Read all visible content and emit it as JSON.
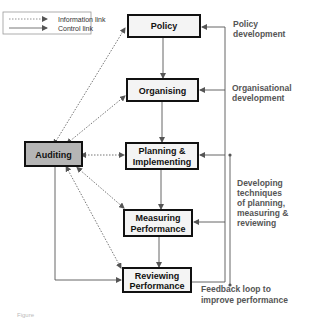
{
  "legend": {
    "information_link": "Information link",
    "control_link": "Control link"
  },
  "boxes": {
    "policy": "Policy",
    "organising": "Organising",
    "planning": [
      "Planning &",
      "Implementing"
    ],
    "measuring": [
      "Measuring",
      "Performance"
    ],
    "reviewing": [
      "Reviewing",
      "Performance"
    ],
    "auditing": "Auditing"
  },
  "annotations": {
    "policy_dev": [
      "Policy",
      "development"
    ],
    "org_dev": [
      "Organisational",
      "development"
    ],
    "techniques": [
      "Developing",
      "techniques",
      "of planning,",
      "measuring &",
      "reviewing"
    ],
    "feedback": [
      "Feedback loop to",
      "improve performance"
    ]
  },
  "caption": "Figure",
  "colors": {
    "box_fill": "#f4f4f4",
    "auditing_fill": "#b5b5b5",
    "line": "#555555",
    "annotation": "#555555"
  }
}
